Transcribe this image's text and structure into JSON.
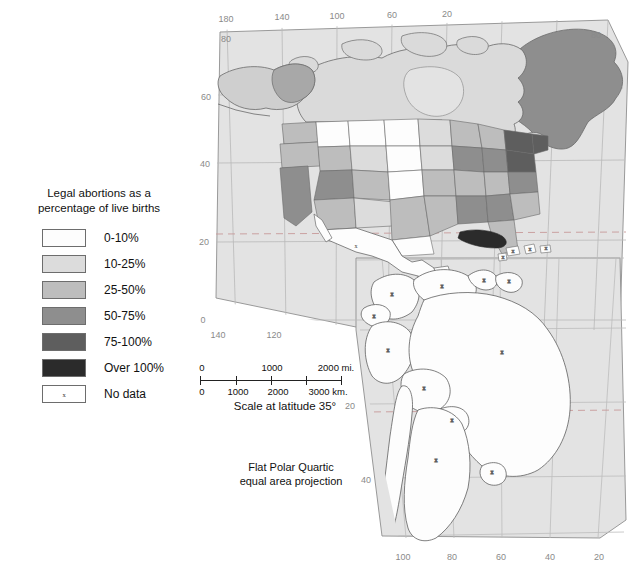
{
  "legend": {
    "title_line1": "Legal abortions as a",
    "title_line2": "percentage of live births",
    "items": [
      {
        "label": "0-10%",
        "color": "#fdfdfd",
        "kind": "swatch"
      },
      {
        "label": "10-25%",
        "color": "#dcdcdc",
        "kind": "swatch"
      },
      {
        "label": "25-50%",
        "color": "#bdbdbd",
        "kind": "swatch"
      },
      {
        "label": "50-75%",
        "color": "#8e8e8e",
        "kind": "swatch"
      },
      {
        "label": "75-100%",
        "color": "#5e5e5e",
        "kind": "swatch"
      },
      {
        "label": "Over 100%",
        "color": "#2b2b2b",
        "kind": "swatch"
      },
      {
        "label": "No data",
        "color": "#ffffff",
        "kind": "nodata",
        "mark": "x"
      }
    ]
  },
  "scalebar": {
    "miles_labels": [
      "0",
      "1000",
      "2000 mi."
    ],
    "km_labels": [
      "0",
      "1000",
      "2000",
      "3000 km."
    ],
    "caption": "Scale at latitude 35°"
  },
  "projection_note": {
    "line1": "Flat Polar Quartic",
    "line2": "equal area projection"
  },
  "graticule": {
    "top_longitudes": [
      "180",
      "140",
      "100",
      "60",
      "20"
    ],
    "bottom_longitudes": [
      "100",
      "80",
      "60",
      "40",
      "20"
    ],
    "inner_bottom_longitudes": [
      "140",
      "120"
    ],
    "left_latitudes": [
      "60",
      "40",
      "20",
      "0"
    ],
    "corner_latitudes": [
      "80",
      "80"
    ],
    "lower_left_latitudes": [
      "20",
      "40"
    ]
  },
  "map": {
    "background_color": "#e2e2e2",
    "ocean_color": "#e2e2e2",
    "border_color": "#6f6f6f",
    "graticule_color": "#b4b4b4",
    "tropic_line_color": "#c08a8a",
    "regions": [
      {
        "name": "greenland",
        "class": "50-75%"
      },
      {
        "name": "canada",
        "class": "10-25%"
      },
      {
        "name": "alaska",
        "class": "25-50%"
      },
      {
        "name": "united-states",
        "class": "mixed"
      },
      {
        "name": "mexico",
        "class": "No data"
      },
      {
        "name": "cuba",
        "class": "Over 100%"
      },
      {
        "name": "central-america",
        "class": "No data"
      },
      {
        "name": "south-america",
        "class": "No data"
      }
    ]
  }
}
